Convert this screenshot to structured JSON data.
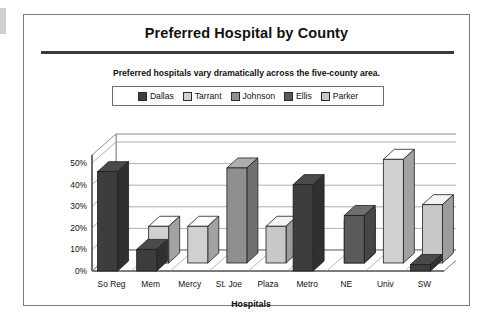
{
  "frame": {
    "title": "Preferred Hospital by County",
    "subtitle": "Preferred hospitals vary dramatically across the five-county area."
  },
  "legend": {
    "entries": [
      {
        "label": "Dallas",
        "color": "#3d3d3d"
      },
      {
        "label": "Tarrant",
        "color": "#d0d0d0"
      },
      {
        "label": "Johnson",
        "color": "#8f8f8f"
      },
      {
        "label": "Ellis",
        "color": "#5a5a5a"
      },
      {
        "label": "Parker",
        "color": "#c8c8c8"
      }
    ]
  },
  "axis": {
    "x_title": "Hospitals",
    "y_ticks": [
      "50%",
      "40%",
      "30%",
      "20%",
      "10%",
      "0%"
    ]
  },
  "chart_data": {
    "type": "bar",
    "title": "Preferred Hospital by County",
    "subtitle": "Preferred hospitals vary dramatically across the five-county area.",
    "xlabel": "Hospitals",
    "ylabel": "",
    "ylim": [
      0,
      50
    ],
    "ytick_values": [
      0,
      10,
      20,
      30,
      40,
      50
    ],
    "ytick_labels": [
      "0%",
      "10%",
      "20%",
      "30%",
      "40%",
      "50%"
    ],
    "grid": true,
    "legend_position": "top",
    "three_d": true,
    "categories": [
      "So Reg",
      "Mem",
      "Mercy",
      "St. Joe",
      "Plaza",
      "Metro",
      "NE",
      "Univ",
      "SW"
    ],
    "series": [
      {
        "name": "Dallas",
        "color": "#3d3d3d",
        "values": [
          46,
          10,
          0,
          0,
          0,
          40,
          0,
          0,
          3
        ]
      },
      {
        "name": "Tarrant",
        "color": "#d0d0d0",
        "values": [
          0,
          17,
          17,
          0,
          0,
          0,
          0,
          48,
          0
        ]
      },
      {
        "name": "Johnson",
        "color": "#8f8f8f",
        "values": [
          0,
          0,
          0,
          44,
          0,
          0,
          20,
          0,
          0
        ]
      },
      {
        "name": "Ellis",
        "color": "#5a5a5a",
        "values": [
          0,
          0,
          0,
          0,
          0,
          0,
          22,
          0,
          0
        ]
      },
      {
        "name": "Parker",
        "color": "#c8c8c8",
        "values": [
          0,
          0,
          0,
          0,
          17,
          0,
          0,
          0,
          27
        ]
      }
    ]
  }
}
